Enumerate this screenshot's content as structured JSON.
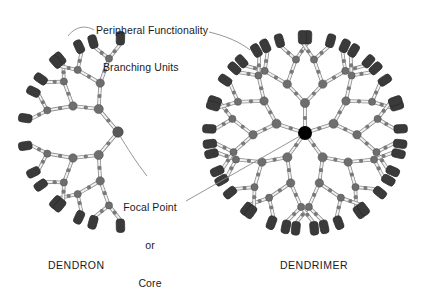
{
  "figure": {
    "background": "#ffffff",
    "annotations": {
      "peripheral": "Peripheral Functionality",
      "branching": "Branching Units",
      "focal_line1": "Focal Point",
      "focal_line2": "or",
      "focal_line3": "Core"
    },
    "captions": {
      "left": "DENDRON",
      "right": "DENDRIMER"
    }
  },
  "chart_data": {
    "type": "diagram",
    "colors": {
      "core_black": "#000000",
      "node_gray": "#6e6e6e",
      "node_gray_dark": "#595959",
      "minor_dot": "#7a7a7a",
      "bond_fill": "#f2f2f2",
      "bond_stroke": "#8c8c8c",
      "terminal_fill": "#3a3a3a",
      "terminal_stroke": "#2a2a2a",
      "leader_line": "#8a8a8a",
      "text": "#1a1a1a"
    },
    "structures": [
      {
        "name": "dendron",
        "caption": "DENDRON",
        "focal_point": {
          "x": 118,
          "y": 132,
          "type": "gray-node"
        },
        "generations": 3,
        "branch_multiplicity": 2,
        "primary_arms": 2,
        "terminal_count": 16,
        "angular_span_deg": 200,
        "center_angle_deg": 180,
        "radii": [
          30,
          52,
          74
        ],
        "terminal_radius": 88
      },
      {
        "name": "dendrimer",
        "caption": "DENDRIMER",
        "core": {
          "x": 305,
          "y": 133,
          "type": "black-core",
          "radius": 7
        },
        "generations": 3,
        "branch_multiplicity": 2,
        "primary_arms": 5,
        "terminal_count": 32,
        "angular_span_deg": 360,
        "radii": [
          30,
          52,
          74
        ],
        "terminal_radius": 90
      }
    ],
    "legend_annotations": [
      {
        "label": "Peripheral Functionality",
        "points_to": [
          "dendron-terminal",
          "dendrimer-terminal"
        ]
      },
      {
        "label": "Branching Units",
        "points_to": [
          "branch-node"
        ]
      },
      {
        "label": "Focal Point or Core",
        "points_to": [
          "dendron-focal-point",
          "dendrimer-core"
        ]
      }
    ]
  }
}
